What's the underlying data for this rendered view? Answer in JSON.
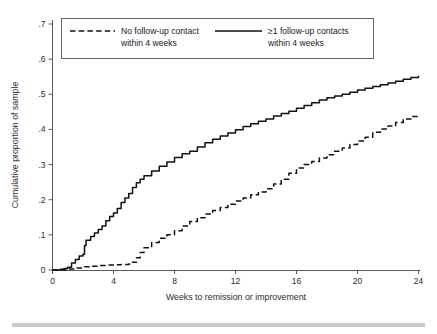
{
  "figure": {
    "background": "#ffffff",
    "line_color": "#111111",
    "axis_color": "#4a4a4a",
    "footer_bar_color": "#c9c9c9"
  },
  "chart_data": {
    "type": "line",
    "title": "",
    "subtitle": "",
    "xlabel": "Weeks to remission or improvement",
    "ylabel": "Cumulative proportion of sample",
    "xlim": [
      0,
      24
    ],
    "ylim": [
      0,
      0.7
    ],
    "xticks": [
      0,
      4,
      8,
      12,
      16,
      20,
      24
    ],
    "xticklabels": [
      "0",
      "4",
      "8",
      "12",
      "16",
      "20",
      "24"
    ],
    "yticks": [
      0,
      0.1,
      0.2,
      0.3,
      0.4,
      0.5,
      0.6,
      0.7
    ],
    "yticklabels": [
      "0",
      ".1",
      ".2",
      ".3",
      ".4",
      ".5",
      ".6",
      ".7"
    ],
    "grid": false,
    "legend_position": "top-inside",
    "series": [
      {
        "name": "No follow-up contact within 4 weeks",
        "style": "dashed",
        "x": [
          0,
          0.5,
          1,
          1.5,
          2,
          2.5,
          3,
          3.5,
          4,
          4.5,
          5,
          5.25,
          5.5,
          5.75,
          6,
          6.5,
          7,
          7.5,
          8,
          8.5,
          9,
          9.5,
          10,
          10.5,
          11,
          11.5,
          12,
          12.5,
          13,
          13.5,
          14,
          14.5,
          15,
          15.5,
          16,
          16.5,
          17,
          17.5,
          18,
          18.5,
          19,
          19.5,
          20,
          20.5,
          21,
          21.5,
          22,
          22.5,
          23,
          23.5,
          24
        ],
        "y": [
          0.0,
          0.0,
          0.003,
          0.006,
          0.009,
          0.011,
          0.013,
          0.014,
          0.015,
          0.016,
          0.017,
          0.022,
          0.035,
          0.05,
          0.063,
          0.078,
          0.09,
          0.1,
          0.112,
          0.125,
          0.138,
          0.149,
          0.159,
          0.169,
          0.178,
          0.187,
          0.196,
          0.205,
          0.214,
          0.222,
          0.231,
          0.245,
          0.258,
          0.275,
          0.29,
          0.3,
          0.309,
          0.319,
          0.328,
          0.338,
          0.347,
          0.357,
          0.367,
          0.378,
          0.392,
          0.401,
          0.41,
          0.42,
          0.43,
          0.437,
          0.443
        ]
      },
      {
        "name": "≥1 follow-up contacts within 4 weeks",
        "style": "solid",
        "x": [
          0,
          0.5,
          0.75,
          1,
          1.25,
          1.5,
          1.75,
          2,
          2.1,
          2.2,
          2.5,
          2.75,
          3,
          3.25,
          3.5,
          3.75,
          4,
          4.25,
          4.5,
          4.75,
          5,
          5.25,
          5.5,
          5.75,
          6,
          6.5,
          7,
          7.5,
          8,
          8.5,
          9,
          9.5,
          10,
          10.5,
          11,
          11.5,
          12,
          12.5,
          13,
          13.5,
          14,
          14.5,
          15,
          15.5,
          16,
          16.5,
          17,
          17.5,
          18,
          18.5,
          19,
          19.5,
          20,
          20.5,
          21,
          21.5,
          22,
          22.5,
          23,
          23.5,
          24
        ],
        "y": [
          0.0,
          0.002,
          0.004,
          0.008,
          0.02,
          0.03,
          0.04,
          0.045,
          0.07,
          0.085,
          0.095,
          0.105,
          0.115,
          0.125,
          0.14,
          0.152,
          0.162,
          0.175,
          0.192,
          0.205,
          0.218,
          0.235,
          0.248,
          0.258,
          0.268,
          0.282,
          0.295,
          0.307,
          0.32,
          0.331,
          0.338,
          0.35,
          0.362,
          0.372,
          0.381,
          0.39,
          0.399,
          0.408,
          0.416,
          0.423,
          0.43,
          0.438,
          0.445,
          0.452,
          0.46,
          0.468,
          0.476,
          0.484,
          0.49,
          0.495,
          0.5,
          0.506,
          0.512,
          0.517,
          0.522,
          0.527,
          0.532,
          0.537,
          0.543,
          0.548,
          0.553
        ]
      }
    ]
  },
  "legend": {
    "entries": [
      {
        "style": "dashed",
        "line1": "No follow-up contact",
        "line2": "within 4 weeks"
      },
      {
        "style": "solid",
        "line1": "≥1 follow-up contacts",
        "line2": "within 4 weeks"
      }
    ]
  }
}
